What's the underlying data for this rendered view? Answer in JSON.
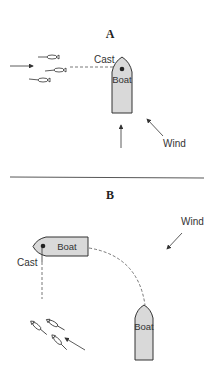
{
  "panel_a": {
    "title": "A",
    "boat_label": "Boat",
    "cast_label": "Cast",
    "wind_label": "Wind"
  },
  "panel_b": {
    "title": "B",
    "boat1_label": "Boat",
    "boat2_label": "Boat",
    "cast_label": "Cast",
    "wind_label": "Wind"
  },
  "colors": {
    "boat_fill": "#d9d9d9",
    "stroke": "#333333",
    "divider": "#444444"
  }
}
